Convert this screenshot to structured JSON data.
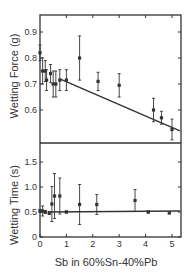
{
  "chart_data": [
    {
      "type": "scatter",
      "panel": "top",
      "title": "",
      "xlabel": "Sb in 60%Sn-40%Pb",
      "ylabel": "Wetting Force (g)",
      "xlim": [
        0,
        5.3
      ],
      "ylim": [
        0.5,
        0.96
      ],
      "x_ticks": [
        0,
        1,
        2,
        3,
        4,
        5
      ],
      "y_ticks": [
        0.6,
        0.7,
        0.8,
        0.9
      ],
      "y_tick_labels": [
        "0.6",
        "0.7",
        "0.8",
        "0.9"
      ],
      "grid": false,
      "points": [
        {
          "x": 0.0,
          "y": 0.82,
          "err": 0.03
        },
        {
          "x": 0.1,
          "y": 0.75,
          "err": 0.05
        },
        {
          "x": 0.2,
          "y": 0.75,
          "err": 0.04
        },
        {
          "x": 0.25,
          "y": 0.715,
          "err": 0.04
        },
        {
          "x": 0.4,
          "y": 0.74,
          "err": 0.035
        },
        {
          "x": 0.5,
          "y": 0.7,
          "err": 0.05
        },
        {
          "x": 0.6,
          "y": 0.7,
          "err": 0.05
        },
        {
          "x": 0.75,
          "y": 0.715,
          "err": 0.04
        },
        {
          "x": 1.0,
          "y": 0.715,
          "err": 0.04
        },
        {
          "x": 1.5,
          "y": 0.8,
          "err": 0.085
        },
        {
          "x": 2.2,
          "y": 0.71,
          "err": 0.035
        },
        {
          "x": 3.0,
          "y": 0.695,
          "err": 0.045
        },
        {
          "x": 4.3,
          "y": 0.6,
          "err": 0.045
        },
        {
          "x": 4.6,
          "y": 0.57,
          "err": 0.025
        },
        {
          "x": 5.0,
          "y": 0.525,
          "err": 0.04
        }
      ],
      "fit_line": {
        "x": [
          0.75,
          5.3
        ],
        "y": [
          0.72,
          0.52
        ]
      }
    },
    {
      "type": "scatter",
      "panel": "bottom",
      "title": "",
      "xlabel": "Sb in 60%Sn-40%Pb",
      "ylabel": "Wetting Time (s)",
      "xlim": [
        0,
        5.3
      ],
      "ylim": [
        0,
        1.85
      ],
      "x_ticks": [
        0,
        1,
        2,
        3,
        4,
        5
      ],
      "x_tick_labels": [
        "0",
        "1",
        "2",
        "3",
        "4",
        "5"
      ],
      "y_ticks": [
        0,
        0.5,
        1.0,
        1.5
      ],
      "y_tick_labels": [
        "0",
        "0.5",
        "1.0",
        "1.5"
      ],
      "grid": false,
      "points": [
        {
          "x": 0.0,
          "y": 0.52,
          "err": 0.03
        },
        {
          "x": 0.1,
          "y": 0.52,
          "err": 0.1
        },
        {
          "x": 0.2,
          "y": 0.5,
          "err": 0.03
        },
        {
          "x": 0.35,
          "y": 0.48,
          "err": 0.03
        },
        {
          "x": 0.45,
          "y": 0.66,
          "err": 0.35
        },
        {
          "x": 0.55,
          "y": 0.82,
          "err": 0.45
        },
        {
          "x": 0.75,
          "y": 0.82,
          "err": 0.36
        },
        {
          "x": 1.0,
          "y": 0.5,
          "err": 0.02
        },
        {
          "x": 1.5,
          "y": 0.65,
          "err": 0.4
        },
        {
          "x": 2.15,
          "y": 0.65,
          "err": 0.2
        },
        {
          "x": 3.6,
          "y": 0.73,
          "err": 0.22
        },
        {
          "x": 4.1,
          "y": 0.5,
          "err": 0.02
        },
        {
          "x": 4.9,
          "y": 0.48,
          "err": 0.01
        }
      ],
      "fit_line": {
        "x": [
          0.3,
          5.3
        ],
        "y": [
          0.5,
          0.52
        ]
      }
    }
  ],
  "labels": {
    "top_ylabel": "Wetting Force (g)",
    "bottom_ylabel": "Wetting Time (s)",
    "xlabel": "Sb in 60%Sn-40%Pb"
  },
  "colors": {
    "ink": "#333333",
    "background": "#ffffff"
  }
}
